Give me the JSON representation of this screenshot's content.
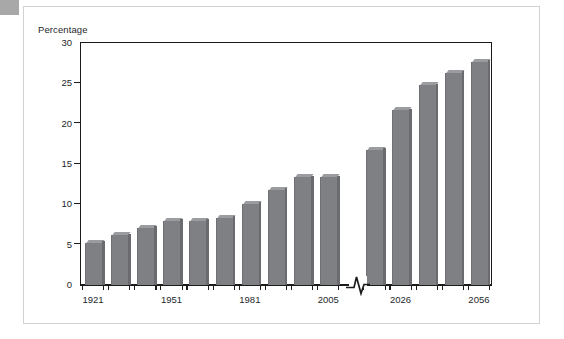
{
  "figure": {
    "ylabel": "Percentage"
  },
  "chart_data": {
    "type": "bar",
    "title": "",
    "xlabel": "",
    "ylabel": "Percentage",
    "ylim": [
      0,
      30
    ],
    "yticks": [
      0,
      5,
      10,
      15,
      20,
      25,
      30
    ],
    "ytick_labels": [
      "0",
      "5",
      "10",
      "15",
      "20",
      "25",
      "30"
    ],
    "grid": false,
    "legend": null,
    "axis_break": {
      "present": true,
      "between": [
        "2005",
        "2026"
      ],
      "symbol": "zigzag"
    },
    "categories": [
      "1921",
      "1931",
      "1941",
      "1951",
      "1961",
      "1971",
      "1981",
      "1991",
      "2001",
      "2005",
      "2016",
      "2026",
      "2036",
      "2046",
      "2056"
    ],
    "xtick_labels": [
      "1921",
      "1951",
      "1981",
      "2005",
      "2026",
      "2056"
    ],
    "values": [
      5.2,
      6.1,
      7.0,
      7.9,
      7.9,
      8.3,
      10.0,
      11.7,
      13.3,
      13.3,
      16.7,
      21.6,
      24.7,
      26.2,
      27.6
    ],
    "bar_color": "#7f8083",
    "bar_top_color": "#9a9c9f",
    "axis_color": "#1b1b1b"
  }
}
